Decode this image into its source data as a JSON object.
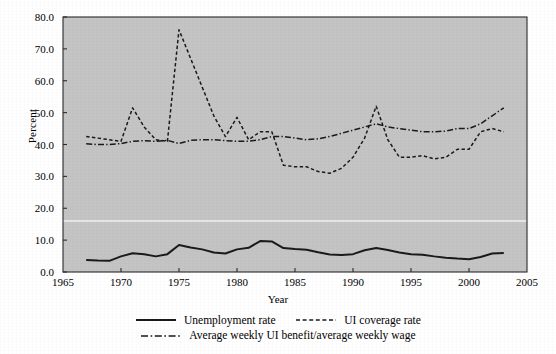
{
  "chart_data": {
    "type": "line",
    "title": "",
    "xlabel": "Year",
    "ylabel": "Percent",
    "xlim": [
      1965,
      2005
    ],
    "ylim": [
      0.0,
      80.0
    ],
    "xticks": [
      "1965",
      "1970",
      "1975",
      "1980",
      "1985",
      "1990",
      "1995",
      "2000",
      "2005"
    ],
    "yticks": [
      "0.0",
      "10.0",
      "20.0",
      "30.0",
      "40.0",
      "50.0",
      "60.0",
      "70.0",
      "80.0"
    ],
    "grid": false,
    "legend_position": "bottom",
    "plot_background": "#c4c4c4",
    "line_color": "#1a1a1a",
    "x": [
      1967,
      1968,
      1969,
      1970,
      1971,
      1972,
      1973,
      1974,
      1975,
      1976,
      1977,
      1978,
      1979,
      1980,
      1981,
      1982,
      1983,
      1984,
      1985,
      1986,
      1987,
      1988,
      1989,
      1990,
      1991,
      1992,
      1993,
      1994,
      1995,
      1996,
      1997,
      1998,
      1999,
      2000,
      2001,
      2002,
      2003
    ],
    "series": [
      {
        "name": "Unemployment rate",
        "style": "solid",
        "values": [
          3.8,
          3.6,
          3.5,
          4.9,
          5.9,
          5.6,
          4.9,
          5.6,
          8.5,
          7.7,
          7.1,
          6.1,
          5.8,
          7.1,
          7.6,
          9.7,
          9.6,
          7.5,
          7.2,
          7.0,
          6.2,
          5.5,
          5.3,
          5.6,
          6.8,
          7.5,
          6.9,
          6.1,
          5.6,
          5.4,
          4.9,
          4.5,
          4.2,
          4.0,
          4.7,
          5.8,
          6.0
        ]
      },
      {
        "name": "UI coverage rate",
        "style": "dashed",
        "values": [
          42.5,
          42.0,
          41.5,
          41.0,
          51.5,
          45.5,
          41.5,
          41.0,
          76.0,
          67.0,
          58.0,
          49.0,
          42.5,
          48.5,
          41.5,
          44.0,
          44.0,
          33.5,
          33.0,
          33.0,
          31.5,
          31.0,
          32.5,
          36.0,
          42.0,
          52.0,
          41.5,
          36.0,
          36.0,
          36.5,
          35.5,
          36.0,
          38.5,
          38.5,
          44.0,
          45.0,
          44.0
        ]
      },
      {
        "name": "Average weekly UI benefit/average weekly wage",
        "style": "dashdot",
        "values": [
          40.2,
          40.0,
          40.0,
          40.3,
          41.0,
          41.2,
          41.0,
          41.3,
          40.3,
          41.3,
          41.5,
          41.5,
          41.2,
          41.0,
          41.0,
          41.5,
          42.5,
          42.5,
          42.0,
          41.5,
          41.8,
          42.5,
          43.5,
          44.5,
          45.5,
          46.5,
          45.5,
          45.0,
          44.5,
          44.0,
          44.0,
          44.2,
          45.0,
          45.0,
          46.5,
          49.0,
          51.5
        ]
      }
    ],
    "annotations": [
      {
        "text": "white horizontal reference line",
        "value": 16.0
      }
    ]
  },
  "legend": {
    "unemployment_label": "Unemployment rate",
    "coverage_label": "UI coverage rate",
    "benefit_label": "Average weekly UI benefit/average weekly wage"
  }
}
